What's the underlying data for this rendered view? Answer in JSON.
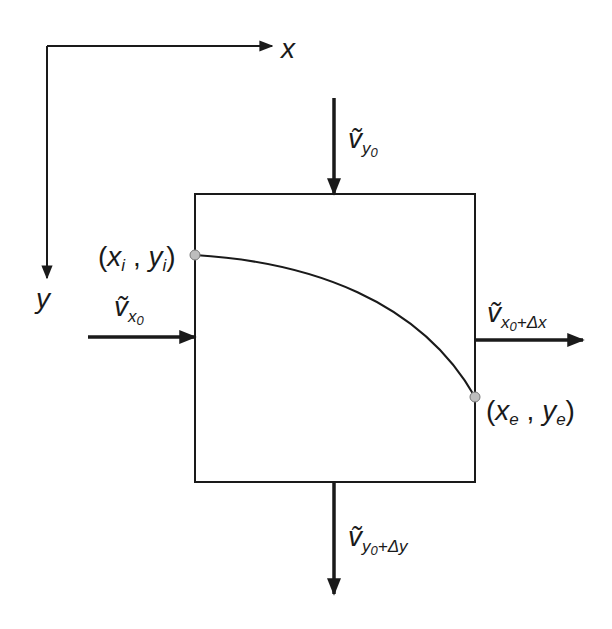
{
  "axes": {
    "x_label": "x",
    "y_label": "y"
  },
  "point_entry": {
    "label_open": "(",
    "x": "x",
    "x_sub": "i",
    "sep": " , ",
    "y": "y",
    "y_sub": "i",
    "label_close": ")"
  },
  "point_exit": {
    "label_open": "(",
    "x": "x",
    "x_sub": "e",
    "sep": " , ",
    "y": "y",
    "y_sub": "e",
    "label_close": ")"
  },
  "arrows": {
    "top": {
      "symbol": "ṽ",
      "sub": "y",
      "sub2": "0",
      "extra": ""
    },
    "left": {
      "symbol": "ṽ",
      "sub": "x",
      "sub2": "0",
      "extra": ""
    },
    "right": {
      "symbol": "ṽ",
      "sub": "x",
      "sub2": "0",
      "extra": "+Δx"
    },
    "bottom": {
      "symbol": "ṽ",
      "sub": "y",
      "sub2": "0",
      "extra": "+Δy"
    }
  },
  "colors": {
    "line": "#1a1a1a",
    "point_fill": "#bdbdbd",
    "background": "#ffffff"
  }
}
